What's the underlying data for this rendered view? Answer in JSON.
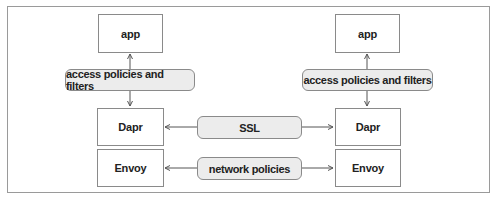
{
  "diagram": {
    "left": {
      "app": "app",
      "filter": "access policies and filters",
      "dapr": "Dapr",
      "envoy": "Envoy"
    },
    "right": {
      "app": "app",
      "filter": "access policies and filters",
      "dapr": "Dapr",
      "envoy": "Envoy"
    },
    "middle": {
      "ssl": "SSL",
      "network": "network policies"
    },
    "colors": {
      "border": "#8a8a8a",
      "pill_fill": "#ececec",
      "line": "#555555"
    }
  }
}
